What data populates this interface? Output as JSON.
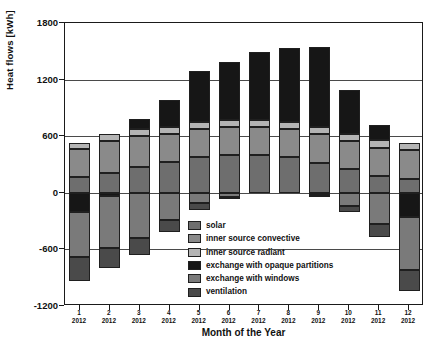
{
  "chart_data": {
    "type": "bar",
    "stacked": true,
    "title": "",
    "xlabel": "Month of the Year",
    "ylabel": "Heat flows [kWh]",
    "ylim": [
      -1200,
      1800
    ],
    "yticks": [
      1800,
      1200,
      600,
      0,
      -600,
      -1200
    ],
    "grid": true,
    "legend_position": "inside-bottom-center",
    "categories": [
      "1",
      "2",
      "3",
      "4",
      "5",
      "6",
      "7",
      "8",
      "9",
      "10",
      "11",
      "12"
    ],
    "category_sublabels": [
      "2012",
      "2012",
      "2012",
      "2012",
      "2012",
      "2012",
      "2012",
      "2012",
      "2012",
      "2012",
      "2012",
      "2012"
    ],
    "series": [
      {
        "name": "solar",
        "color": "#6e6e6e",
        "values": [
          170,
          215,
          270,
          330,
          380,
          400,
          400,
          380,
          320,
          250,
          180,
          150
        ]
      },
      {
        "name": "inner source convective",
        "color": "#8a8a8a",
        "values": [
          290,
          330,
          330,
          290,
          300,
          300,
          300,
          300,
          300,
          300,
          300,
          300
        ]
      },
      {
        "name": "inner source radiant",
        "color": "#b4b4b4",
        "values": [
          70,
          75,
          75,
          75,
          75,
          75,
          75,
          75,
          75,
          75,
          75,
          75
        ]
      },
      {
        "name": "exchange with opaque partitions",
        "color": "#161616",
        "values": [
          -200,
          -30,
          110,
          290,
          540,
          610,
          720,
          780,
          850,
          460,
          160,
          -260
        ]
      },
      {
        "name": "exchange with windows",
        "color": "#7a7a7a",
        "values": [
          -480,
          -560,
          -480,
          -290,
          -110,
          -40,
          0,
          0,
          -20,
          -140,
          -330,
          -560
        ]
      },
      {
        "name": "ventilation",
        "color": "#4a4a4a",
        "values": [
          -260,
          -210,
          -180,
          -130,
          -70,
          -30,
          0,
          0,
          -10,
          -60,
          -140,
          -220
        ]
      }
    ]
  },
  "legend": {
    "items": [
      {
        "label": "solar",
        "color": "#6e6e6e"
      },
      {
        "label": "inner source convective",
        "color": "#8a8a8a"
      },
      {
        "label": "inner source radiant",
        "color": "#b4b4b4"
      },
      {
        "label": "exchange with opaque partitions",
        "color": "#161616"
      },
      {
        "label": "exchange with windows",
        "color": "#7a7a7a"
      },
      {
        "label": "ventilation",
        "color": "#4a4a4a"
      }
    ]
  }
}
